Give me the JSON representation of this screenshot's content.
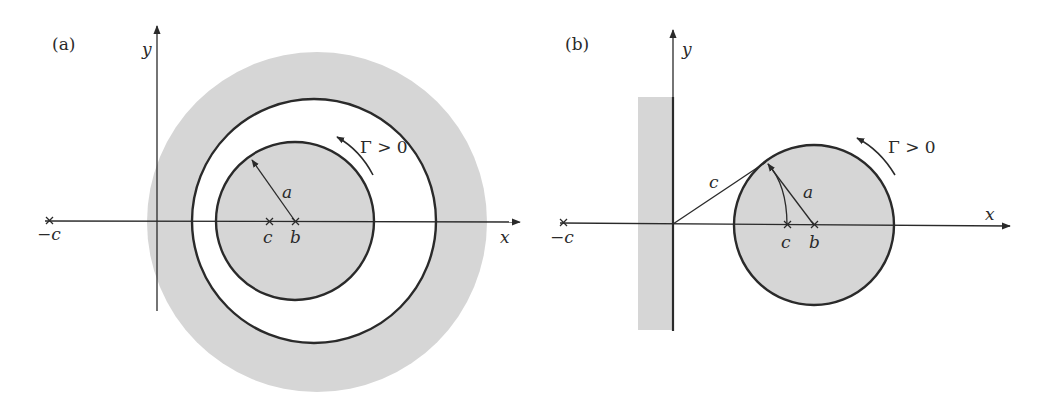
{
  "figure": {
    "panels": [
      {
        "id": "a",
        "label": "(a)",
        "axes": {
          "x_label": "x",
          "y_label": "y"
        },
        "points": {
          "neg_c": "−c",
          "c": "c",
          "b": "b"
        },
        "radius_label": "a",
        "circulation_label": "Γ > 0",
        "description": "Eccentric annulus: inner shaded cylinder of radius a centred at b, white fluid annulus, shaded outer region"
      },
      {
        "id": "b",
        "label": "(b)",
        "axes": {
          "x_label": "x",
          "y_label": "y"
        },
        "points": {
          "neg_c": "−c",
          "c": "c",
          "b": "b"
        },
        "radius_label": "a",
        "tangent_label": "c",
        "circulation_label": "Γ > 0",
        "description": "Cylinder of radius a centred at b next to a plane wall along the y-axis (shaded strip), tangent length c from origin"
      }
    ],
    "colors": {
      "line": "#2a2a2a",
      "shade": "#d6d6d6",
      "background": "#ffffff"
    }
  }
}
